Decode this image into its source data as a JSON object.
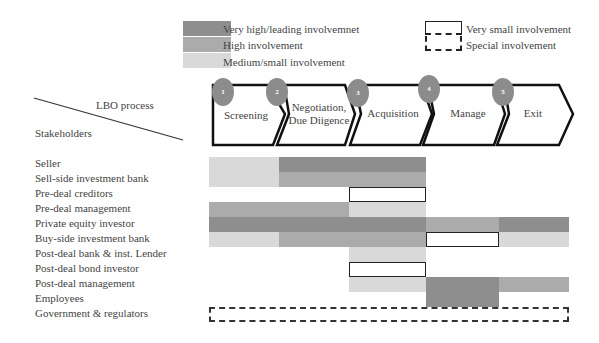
{
  "legend": {
    "fill_items": [
      {
        "level": "very_high",
        "label": "Very high/leading involvemnet",
        "color": "#8e8e8e"
      },
      {
        "level": "high",
        "label": "High involvement",
        "color": "#ababab"
      },
      {
        "level": "medium",
        "label": "Medium/small involvement",
        "color": "#d9d9d9"
      }
    ],
    "outline_items": [
      {
        "level": "very_small",
        "label": "Very small involvement",
        "style": "solid"
      },
      {
        "level": "special",
        "label": "Special involvement",
        "style": "dashed"
      }
    ]
  },
  "header": {
    "process_label": "LBO process",
    "stakeholders_label": "Stakeholders"
  },
  "process_steps": [
    {
      "number": "1",
      "label": "Screening"
    },
    {
      "number": "2",
      "label": "Negotiation, Due Diigence"
    },
    {
      "number": "3",
      "label": "Acquisition"
    },
    {
      "number": "4",
      "label": "Manage"
    },
    {
      "number": "5",
      "label": "Exit"
    }
  ],
  "stakeholders": [
    {
      "label": "Seller",
      "segments": [
        {
          "from": 209,
          "to": 279,
          "level": "md"
        },
        {
          "from": 279,
          "to": 426,
          "level": "vh"
        }
      ]
    },
    {
      "label": "Sell-side investment bank",
      "segments": [
        {
          "from": 209,
          "to": 279,
          "level": "md"
        },
        {
          "from": 279,
          "to": 426,
          "level": "hi"
        }
      ]
    },
    {
      "label": "Pre-deal creditors",
      "segments": [
        {
          "from": 349,
          "to": 426,
          "level": "vs"
        }
      ]
    },
    {
      "label": "Pre-deal management",
      "segments": [
        {
          "from": 209,
          "to": 349,
          "level": "hi"
        },
        {
          "from": 349,
          "to": 426,
          "level": "md"
        }
      ]
    },
    {
      "label": "Private equity investor",
      "segments": [
        {
          "from": 209,
          "to": 426,
          "level": "vh"
        },
        {
          "from": 426,
          "to": 499,
          "level": "hi"
        },
        {
          "from": 499,
          "to": 569,
          "level": "vh"
        }
      ]
    },
    {
      "label": "Buy-side investment bank",
      "segments": [
        {
          "from": 209,
          "to": 279,
          "level": "md"
        },
        {
          "from": 279,
          "to": 426,
          "level": "hi"
        },
        {
          "from": 426,
          "to": 499,
          "level": "vs"
        },
        {
          "from": 499,
          "to": 569,
          "level": "md"
        }
      ]
    },
    {
      "label": "Post-deal bank & inst. Lender",
      "segments": [
        {
          "from": 349,
          "to": 426,
          "level": "md"
        }
      ]
    },
    {
      "label": "Post-deal bond investor",
      "segments": [
        {
          "from": 349,
          "to": 426,
          "level": "vs"
        }
      ]
    },
    {
      "label": "Post-deal management",
      "segments": [
        {
          "from": 349,
          "to": 426,
          "level": "md"
        },
        {
          "from": 426,
          "to": 499,
          "level": "vh"
        },
        {
          "from": 499,
          "to": 569,
          "level": "hi"
        }
      ]
    },
    {
      "label": "Employees",
      "segments": [
        {
          "from": 426,
          "to": 499,
          "level": "vh"
        }
      ]
    },
    {
      "label": "Government & regulators",
      "segments": [
        {
          "from": 209,
          "to": 569,
          "level": "sp"
        }
      ]
    }
  ]
}
